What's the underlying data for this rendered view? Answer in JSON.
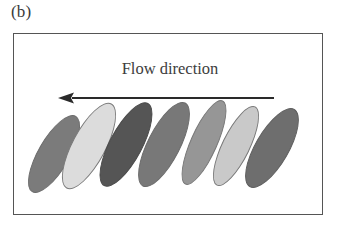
{
  "panel": {
    "label": "(b)"
  },
  "frame": {
    "border_color": "#555555",
    "background": "#ffffff"
  },
  "annotation": {
    "flow_label": "Flow direction",
    "arrow": {
      "name": "flow-direction-arrow",
      "direction": "left",
      "color": "#2a2a2a",
      "x_start_px": 260,
      "x_end_px": 44,
      "y_px": 64,
      "head_length_px": 16,
      "head_width_px": 11,
      "shaft_thickness_px": 2
    }
  },
  "chart_data": {
    "type": "diagram",
    "title": "Flow direction",
    "subfigure": "(b)",
    "grain_count": 7,
    "grain_semi_major_px": 88,
    "grain_semi_minor_px": 32,
    "grain_tilt_deg": -62,
    "grains": [
      {
        "index": 1,
        "fill": "#7b7b7b",
        "stroke": "#6b6b6b",
        "cx": 40,
        "cy": 120,
        "w": 88,
        "h": 32,
        "rot": -60,
        "shade": "medium-gray"
      },
      {
        "index": 2,
        "fill": "#dcdcdc",
        "stroke": "#7a7a7a",
        "cx": 75,
        "cy": 112,
        "w": 96,
        "h": 34,
        "rot": -62,
        "shade": "very-light-gray"
      },
      {
        "index": 3,
        "fill": "#555555",
        "stroke": "#4a4a4a",
        "cx": 112,
        "cy": 110,
        "w": 94,
        "h": 33,
        "rot": -62,
        "shade": "dark-gray"
      },
      {
        "index": 4,
        "fill": "#787878",
        "stroke": "#6b6b6b",
        "cx": 150,
        "cy": 110,
        "w": 94,
        "h": 33,
        "rot": -63,
        "shade": "medium-dark-gray"
      },
      {
        "index": 5,
        "fill": "#969696",
        "stroke": "#777777",
        "cx": 190,
        "cy": 108,
        "w": 92,
        "h": 27,
        "rot": -66,
        "shade": "medium-light-gray"
      },
      {
        "index": 6,
        "fill": "#c9c9c9",
        "stroke": "#777777",
        "cx": 222,
        "cy": 112,
        "w": 88,
        "h": 28,
        "rot": -64,
        "shade": "light-gray"
      },
      {
        "index": 7,
        "fill": "#6e6e6e",
        "stroke": "#5e5e5e",
        "cx": 258,
        "cy": 114,
        "w": 90,
        "h": 34,
        "rot": -60,
        "shade": "medium-dark-gray"
      }
    ]
  }
}
